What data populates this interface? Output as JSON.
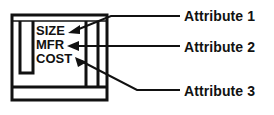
{
  "diagram": {
    "type": "annotated-block-diagram",
    "background_color": "#ffffff",
    "line_color": "#111111",
    "text_color": "#111111",
    "component_box": {
      "name": "component-block",
      "attributes_list": [
        {
          "id": "size",
          "label": "SIZE"
        },
        {
          "id": "mfr",
          "label": "MFR"
        },
        {
          "id": "cost",
          "label": "COST"
        }
      ]
    },
    "callouts": [
      {
        "id": "attribute-1",
        "label": "Attribute 1",
        "points_to": "SIZE"
      },
      {
        "id": "attribute-2",
        "label": "Attribute 2",
        "points_to": "MFR"
      },
      {
        "id": "attribute-3",
        "label": "Attribute 3",
        "points_to": "COST"
      }
    ]
  }
}
